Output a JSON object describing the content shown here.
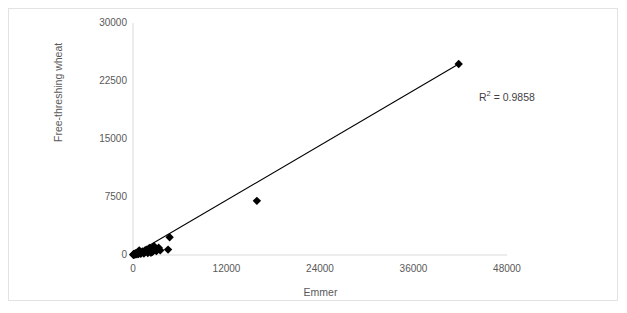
{
  "chart_data": {
    "type": "scatter",
    "title": "",
    "xlabel": "Emmer",
    "ylabel": "Free-threshing wheat",
    "xlim": [
      0,
      48000
    ],
    "ylim": [
      0,
      30000
    ],
    "xticks": [
      0,
      12000,
      24000,
      36000,
      48000
    ],
    "yticks": [
      0,
      7500,
      15000,
      22500,
      30000
    ],
    "xtick_labels": [
      "0",
      "12000",
      "24000",
      "36000",
      "48000"
    ],
    "ytick_labels": [
      "0",
      "7500",
      "15000",
      "22500",
      "30000"
    ],
    "grid": false,
    "legend": null,
    "marker": "diamond",
    "marker_color": "#000000",
    "trendline": {
      "visible": true,
      "color": "#000000",
      "x_start": 200,
      "y_start": 120,
      "x_end": 41800,
      "y_end": 24700
    },
    "annotations": [
      {
        "name": "r-squared",
        "text": "R² = 0.9858",
        "base": "R",
        "exponent": "2",
        "rest": " = 0.9858",
        "x": 44000,
        "y": 21200
      }
    ],
    "points": [
      {
        "x": 41800,
        "y": 24700
      },
      {
        "x": 15900,
        "y": 7000
      },
      {
        "x": 4700,
        "y": 2300
      },
      {
        "x": 4500,
        "y": 700
      },
      {
        "x": 3500,
        "y": 600
      },
      {
        "x": 3300,
        "y": 950
      },
      {
        "x": 3000,
        "y": 500
      },
      {
        "x": 2700,
        "y": 1150
      },
      {
        "x": 2500,
        "y": 400
      },
      {
        "x": 2300,
        "y": 300
      },
      {
        "x": 2100,
        "y": 900
      },
      {
        "x": 1900,
        "y": 250
      },
      {
        "x": 1700,
        "y": 700
      },
      {
        "x": 1500,
        "y": 550
      },
      {
        "x": 1400,
        "y": 200
      },
      {
        "x": 1200,
        "y": 450
      },
      {
        "x": 1000,
        "y": 150
      },
      {
        "x": 900,
        "y": 350
      },
      {
        "x": 800,
        "y": 600
      },
      {
        "x": 700,
        "y": 120
      },
      {
        "x": 600,
        "y": 300
      },
      {
        "x": 500,
        "y": 100
      },
      {
        "x": 400,
        "y": 250
      },
      {
        "x": 300,
        "y": 80
      },
      {
        "x": 250,
        "y": 180
      },
      {
        "x": 200,
        "y": 60
      },
      {
        "x": 150,
        "y": 120
      },
      {
        "x": 100,
        "y": 40
      },
      {
        "x": 60,
        "y": 90
      },
      {
        "x": 30,
        "y": 30
      }
    ]
  }
}
